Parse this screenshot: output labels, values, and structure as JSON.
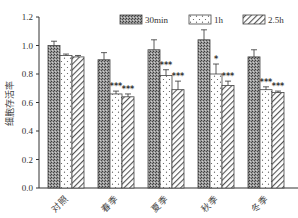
{
  "chart_data": {
    "type": "bar",
    "title": "",
    "xlabel": "",
    "ylabel": "细胞存活率",
    "ylim": [
      0,
      1.2
    ],
    "yticks": [
      0.0,
      0.2,
      0.4,
      0.6,
      0.8,
      1.0,
      1.2
    ],
    "ytick_labels": [
      "0.0",
      "0.2",
      "0.4",
      "0.6",
      "0.8",
      "1.0",
      "1.2"
    ],
    "categories": [
      "对照",
      "春季",
      "夏季",
      "秋季",
      "冬季"
    ],
    "legend_position": "top-right",
    "grid": false,
    "series": [
      {
        "name": "30min",
        "pattern": "dense-crosshatch",
        "values": [
          1.0,
          0.9,
          0.97,
          1.04,
          0.92
        ],
        "errors": [
          0.03,
          0.05,
          0.07,
          0.07,
          0.05
        ],
        "significance": [
          "",
          "",
          "",
          "",
          ""
        ]
      },
      {
        "name": "1h",
        "pattern": "dots",
        "values": [
          0.93,
          0.66,
          0.79,
          0.8,
          0.69
        ],
        "errors": [
          0.01,
          0.02,
          0.04,
          0.07,
          0.02
        ],
        "significance": [
          "",
          "***",
          "***",
          "*",
          "***"
        ]
      },
      {
        "name": "2.5h",
        "pattern": "diagonal-hatch",
        "values": [
          0.92,
          0.64,
          0.69,
          0.72,
          0.67
        ],
        "errors": [
          0.01,
          0.02,
          0.06,
          0.03,
          0.01
        ],
        "significance": [
          "",
          "***",
          "***",
          "***",
          "***"
        ]
      }
    ]
  },
  "legend": {
    "items": [
      {
        "label": "30min"
      },
      {
        "label": "1h"
      },
      {
        "label": "2.5h"
      }
    ]
  },
  "axis": {
    "ylabel": "细胞存活率"
  }
}
